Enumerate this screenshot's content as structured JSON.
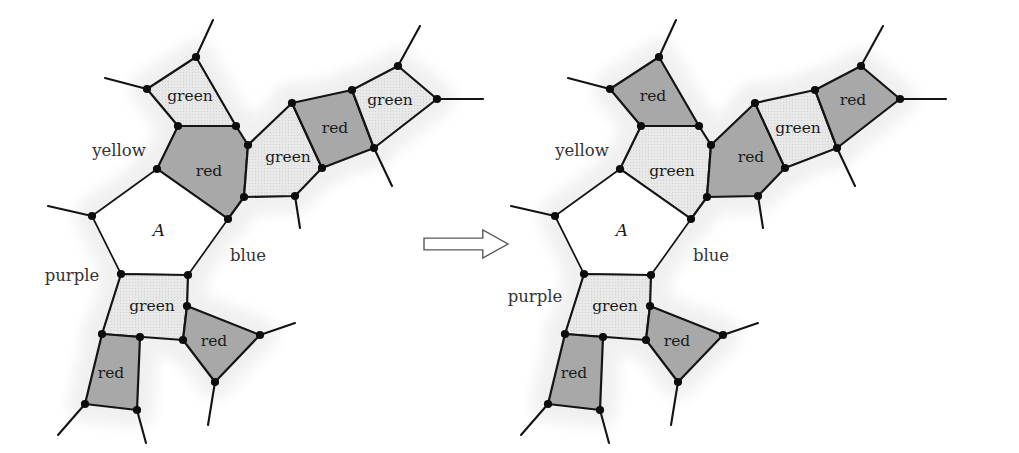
{
  "figure": {
    "kind": "graph-coloring-diagram",
    "background_color": "#ffffff",
    "colors": {
      "red_fill": "#a8a8a8",
      "green_fill": "#e3e3e3",
      "white_fill": "#ffffff",
      "halo_fill": "#f0f0f0",
      "stroke": "#141414",
      "vertex": "#0d0d0d",
      "arrow_stroke": "#5a5a5a"
    },
    "arrow": {
      "name": "implies-arrow",
      "direction": "right",
      "x": 424,
      "y": 230,
      "width": 84,
      "height": 28
    }
  },
  "left_diagram": {
    "name": "before-recoloring",
    "offset_x": 0,
    "center_region": "A",
    "outer_labels": [
      {
        "text": "yellow",
        "x": 119,
        "y": 151
      },
      {
        "text": "purple",
        "x": 72,
        "y": 276
      },
      {
        "text": "blue",
        "x": 248,
        "y": 256
      }
    ],
    "regions": [
      {
        "id": "L1",
        "label": "green",
        "color": "green",
        "label_x": 190,
        "label_y": 97,
        "points": "196,57 236,126 178,126 147,89"
      },
      {
        "id": "L2",
        "label": "red",
        "color": "red",
        "label_x": 209,
        "label_y": 172,
        "points": "178,126 236,126 248,145 244,197 228,219 157,169"
      },
      {
        "id": "L3",
        "label": "green",
        "color": "green",
        "label_x": 288,
        "label_y": 158,
        "points": "248,145 292,103 322,168 295,196 244,197"
      },
      {
        "id": "L4",
        "label": "red",
        "color": "red",
        "label_x": 335,
        "label_y": 129,
        "points": "292,103 352,90 374,148 322,168"
      },
      {
        "id": "L5",
        "label": "green",
        "color": "green",
        "label_x": 390,
        "label_y": 101,
        "points": "352,90 398,66 437,99 374,148"
      },
      {
        "id": "L6",
        "label": "A",
        "color": "white",
        "label_x": 159,
        "label_y": 231,
        "points": "157,169 228,219 188,275 121,274 92,216"
      },
      {
        "id": "L7",
        "label": "green",
        "color": "green",
        "label_x": 152,
        "label_y": 307,
        "points": "121,274 188,275 187,306 183,340 102,334"
      },
      {
        "id": "L8",
        "label": "red",
        "color": "red",
        "label_x": 111,
        "label_y": 374,
        "points": "102,334 140,337 137,410 85,404"
      },
      {
        "id": "L9",
        "label": "red",
        "color": "red",
        "label_x": 214,
        "label_y": 342,
        "points": "187,306 260,335 215,382 183,340"
      }
    ],
    "vertices": [
      [
        196,
        57
      ],
      [
        147,
        89
      ],
      [
        178,
        126
      ],
      [
        236,
        126
      ],
      [
        248,
        145
      ],
      [
        157,
        169
      ],
      [
        292,
        103
      ],
      [
        322,
        168
      ],
      [
        295,
        196
      ],
      [
        244,
        197
      ],
      [
        228,
        219
      ],
      [
        352,
        90
      ],
      [
        374,
        148
      ],
      [
        398,
        66
      ],
      [
        437,
        99
      ],
      [
        92,
        216
      ],
      [
        188,
        275
      ],
      [
        121,
        274
      ],
      [
        187,
        306
      ],
      [
        183,
        340
      ],
      [
        102,
        334
      ],
      [
        140,
        337
      ],
      [
        137,
        410
      ],
      [
        85,
        404
      ],
      [
        260,
        335
      ],
      [
        215,
        382
      ]
    ],
    "stubs": [
      [
        196,
        57,
        213,
        20
      ],
      [
        147,
        89,
        105,
        78
      ],
      [
        92,
        216,
        48,
        206
      ],
      [
        398,
        66,
        420,
        26
      ],
      [
        437,
        99,
        483,
        99
      ],
      [
        374,
        148,
        392,
        186
      ],
      [
        295,
        196,
        300,
        228
      ],
      [
        85,
        404,
        58,
        435
      ],
      [
        137,
        410,
        146,
        443
      ],
      [
        215,
        382,
        208,
        425
      ],
      [
        260,
        335,
        295,
        323
      ]
    ]
  },
  "right_diagram": {
    "name": "after-recoloring",
    "offset_x": 463,
    "center_region": "A",
    "outer_labels": [
      {
        "text": "yellow",
        "x": 582,
        "y": 151
      },
      {
        "text": "purple",
        "x": 535,
        "y": 297
      },
      {
        "text": "blue",
        "x": 711,
        "y": 256
      }
    ],
    "regions": [
      {
        "id": "R1",
        "label": "red",
        "color": "red",
        "label_x": 653,
        "label_y": 97,
        "points": "659,57 699,126 641,126 610,89"
      },
      {
        "id": "R2",
        "label": "green",
        "color": "green",
        "label_x": 672,
        "label_y": 172,
        "points": "641,126 699,126 711,145 707,197 691,219 620,169"
      },
      {
        "id": "R3",
        "label": "red",
        "color": "red",
        "label_x": 751,
        "label_y": 158,
        "points": "711,145 755,103 785,168 758,196 707,197"
      },
      {
        "id": "R4",
        "label": "green",
        "color": "green",
        "label_x": 798,
        "label_y": 129,
        "points": "755,103 815,90 837,148 785,168"
      },
      {
        "id": "R5",
        "label": "red",
        "color": "red",
        "label_x": 853,
        "label_y": 101,
        "points": "815,90 861,66 900,99 837,148"
      },
      {
        "id": "R6",
        "label": "A",
        "color": "white",
        "label_x": 622,
        "label_y": 231,
        "points": "620,169 691,219 651,275 584,274 555,216"
      },
      {
        "id": "R7",
        "label": "green",
        "color": "green",
        "label_x": 615,
        "label_y": 307,
        "points": "584,274 651,275 650,306 646,340 565,334"
      },
      {
        "id": "R8",
        "label": "red",
        "color": "red",
        "label_x": 574,
        "label_y": 374,
        "points": "565,334 603,337 600,410 548,404"
      },
      {
        "id": "R9",
        "label": "red",
        "color": "red",
        "label_x": 677,
        "label_y": 342,
        "points": "650,306 723,335 678,382 646,340"
      }
    ],
    "vertices": [
      [
        659,
        57
      ],
      [
        610,
        89
      ],
      [
        641,
        126
      ],
      [
        699,
        126
      ],
      [
        711,
        145
      ],
      [
        620,
        169
      ],
      [
        755,
        103
      ],
      [
        785,
        168
      ],
      [
        758,
        196
      ],
      [
        707,
        197
      ],
      [
        691,
        219
      ],
      [
        815,
        90
      ],
      [
        837,
        148
      ],
      [
        861,
        66
      ],
      [
        900,
        99
      ],
      [
        555,
        216
      ],
      [
        651,
        275
      ],
      [
        584,
        274
      ],
      [
        650,
        306
      ],
      [
        646,
        340
      ],
      [
        565,
        334
      ],
      [
        603,
        337
      ],
      [
        600,
        410
      ],
      [
        548,
        404
      ],
      [
        723,
        335
      ],
      [
        678,
        382
      ]
    ],
    "stubs": [
      [
        659,
        57,
        676,
        20
      ],
      [
        610,
        89,
        568,
        78
      ],
      [
        555,
        216,
        511,
        206
      ],
      [
        861,
        66,
        883,
        26
      ],
      [
        900,
        99,
        946,
        99
      ],
      [
        837,
        148,
        855,
        186
      ],
      [
        758,
        196,
        763,
        228
      ],
      [
        548,
        404,
        521,
        435
      ],
      [
        600,
        410,
        609,
        443
      ],
      [
        678,
        382,
        671,
        425
      ],
      [
        723,
        335,
        758,
        323
      ]
    ]
  }
}
